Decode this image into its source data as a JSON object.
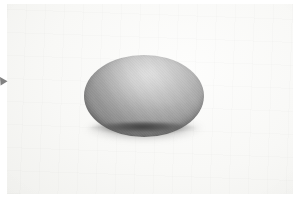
{
  "image": {
    "kind": "photograph",
    "subject": "gray dome-shaped object on white paper",
    "width_px": 298,
    "height_px": 199,
    "alt_text": "Photograph of a matte gray hemispherical dome resting on a plain off-white paper surface, lit from above so the top is pale gray and the lower edge falls into shadow."
  },
  "background": {
    "name": "paper-surface",
    "color": "#F6F6F4",
    "edge_color": "#E9E9E6",
    "description": "plain near-white photographic backdrop"
  },
  "object": {
    "name": "gray-dome",
    "shape": "hemisphere",
    "highlight_color": "#C9C9C9",
    "midtone_color": "#B4B4B4",
    "shadow_color": "#7D7D7D",
    "rim_color": "#3C3C3C",
    "position": {
      "left_px": 77,
      "top_px": 51,
      "width_px": 120,
      "height_px": 82
    }
  },
  "cast_shadow": {
    "name": "contact-shadow",
    "color": "#4A4A4A",
    "position": {
      "left_px": 78,
      "top_px": 112,
      "width_px": 122,
      "height_px": 28
    }
  },
  "edge_marker": {
    "name": "left-edge-arrow-mark",
    "color": "#6B6B6B",
    "position": {
      "left_px": 0,
      "top_px": 77,
      "width_px": 9,
      "height_px": 9
    }
  }
}
